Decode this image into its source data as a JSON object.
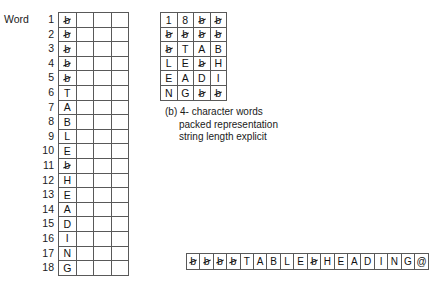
{
  "figure": {
    "word_label": "Word",
    "blank_symbol": "b",
    "caption": {
      "line1": "(b) 4- character words",
      "line2": "packed representation",
      "line3": "string length explicit"
    }
  },
  "left_table": {
    "columns": 4,
    "row_numbers": [
      "1",
      "2",
      "3",
      "4",
      "5",
      "6",
      "7",
      "8",
      "9",
      "10",
      "11",
      "12",
      "13",
      "14",
      "15",
      "16",
      "17",
      "18"
    ],
    "first_column": [
      "b",
      "b",
      "b",
      "b",
      "b",
      "T",
      "A",
      "B",
      "L",
      "E",
      "b",
      "H",
      "E",
      "A",
      "D",
      "I",
      "N",
      "G"
    ],
    "blank_rows": [
      1,
      2,
      3,
      4,
      5,
      11
    ]
  },
  "packed_table": {
    "rows": [
      [
        "1",
        "8",
        "b",
        "b"
      ],
      [
        "b",
        "b",
        "b",
        "b"
      ],
      [
        "b",
        "T",
        "A",
        "B"
      ],
      [
        "L",
        "E",
        "b",
        "H"
      ],
      [
        "E",
        "A",
        "D",
        "I"
      ],
      [
        "N",
        "G",
        "b",
        "b"
      ]
    ]
  },
  "string_strip": {
    "cells": [
      "b",
      "b",
      "b",
      "b",
      "T",
      "A",
      "B",
      "L",
      "E",
      "b",
      "H",
      "E",
      "A",
      "D",
      "I",
      "N",
      "G",
      "@"
    ]
  },
  "colors": {
    "background": "#ffffff",
    "border": "#595959",
    "text": "#111111"
  }
}
